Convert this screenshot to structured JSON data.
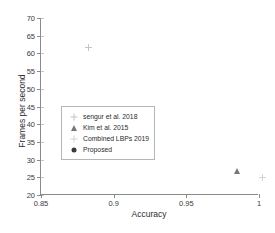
{
  "chart_data": {
    "type": "scatter",
    "title": "",
    "xlabel": "Accuracy",
    "ylabel": "Frames per second",
    "xlim": [
      0.85,
      1.0
    ],
    "ylim": [
      20,
      70
    ],
    "xticks": [
      "0.85",
      "0.9",
      "0.95",
      "1"
    ],
    "xtick_values": [
      0.85,
      0.9,
      0.95,
      1.0
    ],
    "yticks": [
      "20",
      "25",
      "30",
      "35",
      "40",
      "45",
      "50",
      "55",
      "60",
      "65",
      "70"
    ],
    "ytick_values": [
      20,
      25,
      30,
      35,
      40,
      45,
      50,
      55,
      60,
      65,
      70
    ],
    "grid": false,
    "legend_position": "center-left",
    "series": [
      {
        "name": "sengur et al. 2018",
        "marker": "plus",
        "color": "#c4c4c4",
        "points": [
          {
            "x": 0.88,
            "y": 62.7
          }
        ]
      },
      {
        "name": "Kim et al. 2015",
        "marker": "triangle",
        "color": "#777777",
        "points": [
          {
            "x": 0.985,
            "y": 30.0
          }
        ]
      },
      {
        "name": "Combined LBPs 2019",
        "marker": "star",
        "color": "#d3d3d3",
        "points": [
          {
            "x": 1.0,
            "y": 26.0
          }
        ]
      },
      {
        "name": "Proposed",
        "marker": "filled-circle",
        "color": "#3a3a3a",
        "points": [
          {
            "x": 1.0,
            "y": 48.0
          }
        ]
      }
    ]
  }
}
